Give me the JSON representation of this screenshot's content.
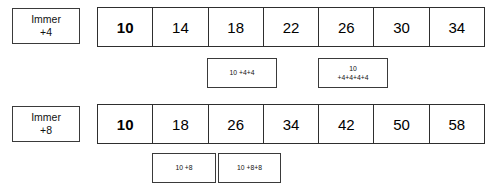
{
  "worksheet": {
    "rows": [
      {
        "label": {
          "word": "Immer",
          "step": "+4"
        },
        "cells": [
          "10",
          "14",
          "18",
          "22",
          "26",
          "30",
          "34"
        ],
        "expressions": [
          {
            "lines": [
              "10 +4+4"
            ]
          },
          {
            "lines": [
              "10",
              "+4+4+4+4"
            ]
          }
        ]
      },
      {
        "label": {
          "word": "Immer",
          "step": "+8"
        },
        "cells": [
          "10",
          "18",
          "26",
          "34",
          "42",
          "50",
          "58"
        ],
        "expressions": [
          {
            "lines": [
              "10 +8"
            ]
          },
          {
            "lines": [
              "10 +8+8"
            ]
          }
        ]
      }
    ]
  },
  "colors": {
    "border": "#2e2e2e",
    "border_light": "#3a3a3a",
    "background": "#ffffff",
    "text": "#000000"
  }
}
